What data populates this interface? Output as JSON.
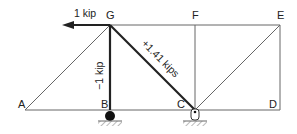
{
  "diagram": {
    "type": "truss",
    "nodes": {
      "A": {
        "label": "A",
        "x": 25,
        "y": 110
      },
      "B": {
        "label": "B",
        "x": 110,
        "y": 110
      },
      "C": {
        "label": "C",
        "x": 195,
        "y": 110
      },
      "D": {
        "label": "D",
        "x": 280,
        "y": 110
      },
      "E": {
        "label": "E",
        "x": 280,
        "y": 25
      },
      "F": {
        "label": "F",
        "x": 195,
        "y": 25
      },
      "G": {
        "label": "G",
        "x": 110,
        "y": 25
      }
    },
    "applied_load": {
      "label": "1 kip",
      "at": "G",
      "direction": "left"
    },
    "member_forces": {
      "GB": "−1 kip",
      "GC": "+1.41 kips"
    },
    "supports": {
      "B": "roller",
      "C": "pin"
    },
    "colors": {
      "line": "#555555",
      "highlight": "#222222"
    }
  }
}
